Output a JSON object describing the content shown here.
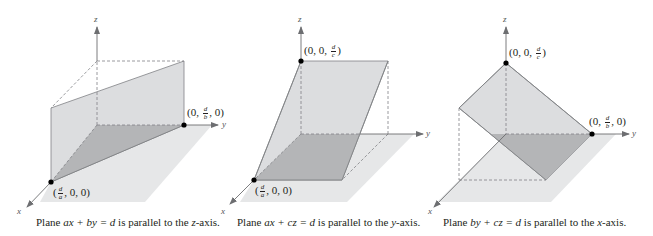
{
  "colors": {
    "floor": "#e6e7e8",
    "plane": "#dcdddf",
    "plane_dark": "#b4b5b7",
    "axis": "#6d6e71",
    "edge": "#808285",
    "dashed": "#808285",
    "point": "#000000"
  },
  "diagrams": [
    {
      "id": "plane-xy",
      "caption": {
        "prefix": "Plane ",
        "equation": "ax + by = d",
        "suffix": " is parallel to the ",
        "axis": "z",
        "end": "-axis."
      },
      "axes": {
        "x_label": "x",
        "y_label": "y",
        "z_label": "z"
      },
      "points": [
        {
          "label_pre": "(0, ",
          "frac_num": "d",
          "frac_den": "b",
          "label_post": ", 0)"
        },
        {
          "label_pre": "(",
          "frac_num": "d",
          "frac_den": "a",
          "label_post": ", 0, 0)"
        }
      ]
    },
    {
      "id": "plane-xz",
      "caption": {
        "prefix": "Plane ",
        "equation": "ax + cz = d",
        "suffix": " is parallel to the ",
        "axis": "y",
        "end": "-axis."
      },
      "axes": {
        "x_label": "x",
        "y_label": "y",
        "z_label": "z"
      },
      "points": [
        {
          "label_pre": "(0, 0, ",
          "frac_num": "d",
          "frac_den": "c",
          "label_post": ")"
        },
        {
          "label_pre": "(",
          "frac_num": "d",
          "frac_den": "a",
          "label_post": ", 0, 0)"
        }
      ]
    },
    {
      "id": "plane-yz",
      "caption": {
        "prefix": "Plane ",
        "equation": "by + cz = d",
        "suffix": " is parallel to the ",
        "axis": "x",
        "end": "-axis."
      },
      "axes": {
        "x_label": "x",
        "y_label": "y",
        "z_label": "z"
      },
      "points": [
        {
          "label_pre": "(0, 0, ",
          "frac_num": "d",
          "frac_den": "c",
          "label_post": ")"
        },
        {
          "label_pre": "(0, ",
          "frac_num": "d",
          "frac_den": "b",
          "label_post": ", 0)"
        }
      ]
    }
  ]
}
